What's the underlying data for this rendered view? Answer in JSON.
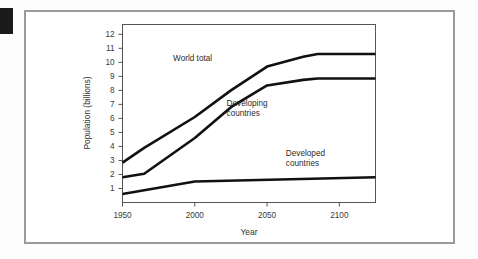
{
  "figure": {
    "background_color": "#ffffff",
    "frame_color": "#9a9a9a",
    "marker_tab_color": "#1a1a1a",
    "line_color": "#111111"
  },
  "chart_data": {
    "type": "line",
    "title": "",
    "xlabel": "Year",
    "ylabel": "Population (billions)",
    "xlim": [
      1950,
      2125
    ],
    "ylim": [
      0,
      12.7
    ],
    "grid": false,
    "legend_position": "inline-annotations",
    "x_ticks": [
      1950,
      2000,
      2050,
      2100
    ],
    "x_tick_labels": [
      "1950",
      "2000",
      "2050",
      "2100"
    ],
    "y_ticks": [
      1,
      2,
      3,
      4,
      5,
      6,
      7,
      8,
      9,
      10,
      11,
      12
    ],
    "y_tick_labels": [
      "1",
      "2",
      "3",
      "4",
      "5",
      "6",
      "7",
      "8",
      "9",
      "10",
      "11",
      "12"
    ],
    "series": [
      {
        "name": "World total",
        "label": "World total",
        "label_x": 1985,
        "label_y": 10.1,
        "x": [
          1950,
          1965,
          2000,
          2025,
          2050,
          2075,
          2085,
          2125
        ],
        "values": [
          2.85,
          3.9,
          6.1,
          8.0,
          9.7,
          10.4,
          10.6,
          10.6
        ]
      },
      {
        "name": "Developing countries",
        "label": "Developing countries",
        "label_line_1": "Developing",
        "label_line_2": "countries",
        "label_x": 2022,
        "label_y": 6.9,
        "x": [
          1950,
          1965,
          2000,
          2025,
          2050,
          2075,
          2085,
          2125
        ],
        "values": [
          1.8,
          2.05,
          4.6,
          6.8,
          8.35,
          8.75,
          8.85,
          8.85
        ]
      },
      {
        "name": "Developed countries",
        "label": "Developed countries",
        "label_line_1": "Developed",
        "label_line_2": "countries",
        "label_x": 2063,
        "label_y": 3.35,
        "x": [
          1950,
          2000,
          2125
        ],
        "values": [
          0.6,
          1.5,
          1.8
        ]
      }
    ]
  }
}
